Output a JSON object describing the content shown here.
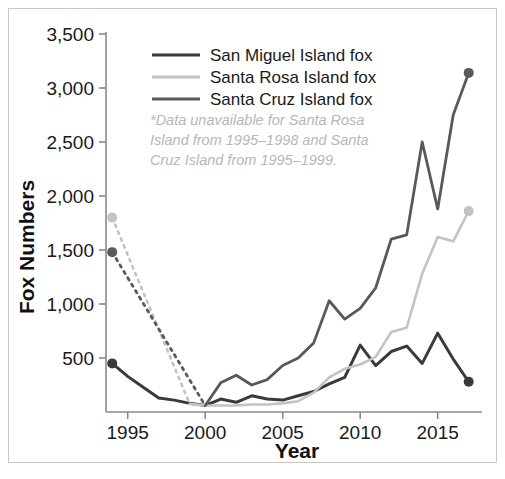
{
  "chart_data": {
    "type": "line",
    "title": "",
    "xlabel": "Year",
    "ylabel": "Fox Numbers",
    "xlim": [
      1993.6,
      2017.6
    ],
    "ylim": [
      0,
      3500
    ],
    "xticks": [
      1995,
      2000,
      2005,
      2010,
      2015
    ],
    "xtick_labels": [
      "1995",
      "2000",
      "2005",
      "2010",
      "2015"
    ],
    "yticks": [
      500,
      1000,
      1500,
      2000,
      2500,
      3000,
      3500
    ],
    "ytick_labels": [
      "500",
      "1,000",
      "1,500",
      "2,000",
      "2,500",
      "3,000",
      "3,500"
    ],
    "grid": false,
    "legend_position": "top-center",
    "annotation": {
      "lines": [
        "*Data unavailable for Santa Rosa",
        "Island from 1995–1998 and Santa",
        "Cruz Island from 1995–1999."
      ],
      "color": "#b7b7b7"
    },
    "series": [
      {
        "name": "San Miguel Island fox",
        "color": "#3a3a3a",
        "width": 3.0,
        "x": [
          1994,
          1995,
          1996,
          1997,
          1998,
          1999,
          2000,
          2001,
          2002,
          2003,
          2004,
          2005,
          2006,
          2007,
          2008,
          2009,
          2010,
          2011,
          2012,
          2013,
          2014,
          2015,
          2016,
          2017
        ],
        "values": [
          450,
          330,
          230,
          130,
          110,
          80,
          60,
          120,
          90,
          150,
          120,
          110,
          150,
          190,
          260,
          320,
          620,
          430,
          560,
          610,
          450,
          730,
          490,
          280
        ],
        "start_marker": true,
        "end_marker": true,
        "dashed_prefix": false
      },
      {
        "name": "Santa Rosa Island fox",
        "color": "#c3c3c3",
        "width": 2.6,
        "x": [
          1994,
          1999,
          2000,
          2001,
          2002,
          2003,
          2004,
          2005,
          2006,
          2007,
          2008,
          2009,
          2010,
          2011,
          2012,
          2013,
          2014,
          2015,
          2016,
          2017
        ],
        "values": [
          1800,
          75,
          60,
          60,
          60,
          70,
          70,
          80,
          100,
          180,
          320,
          400,
          440,
          510,
          740,
          780,
          1280,
          1620,
          1580,
          1860
        ],
        "start_marker": true,
        "end_marker": true,
        "dashed_prefix": true,
        "dashed_note": "1995-1998 unavailable"
      },
      {
        "name": "Santa Cruz Island fox",
        "color": "#595959",
        "width": 2.8,
        "x": [
          1994,
          2000,
          2001,
          2002,
          2003,
          2004,
          2005,
          2006,
          2007,
          2008,
          2009,
          2010,
          2011,
          2012,
          2013,
          2014,
          2015,
          2016,
          2017
        ],
        "values": [
          1480,
          60,
          270,
          340,
          250,
          300,
          430,
          500,
          640,
          1030,
          860,
          960,
          1150,
          1600,
          1640,
          2500,
          1880,
          2750,
          3140
        ],
        "start_marker": true,
        "end_marker": true,
        "dashed_prefix": true,
        "dashed_note": "1995-1999 unavailable"
      }
    ]
  },
  "legend": {
    "items": [
      {
        "label": "San Miguel Island fox",
        "color": "#3a3a3a"
      },
      {
        "label": "Santa Rosa Island fox",
        "color": "#c3c3c3"
      },
      {
        "label": "Santa Cruz Island fox",
        "color": "#595959"
      }
    ]
  },
  "axes": {
    "x_title": "Year",
    "y_title": "Fox Numbers",
    "axis_color": "#8a8a8a",
    "label_color": "#1a1a1a"
  },
  "frame": {
    "border_color": "#c9c9c9",
    "background": "#ffffff"
  }
}
